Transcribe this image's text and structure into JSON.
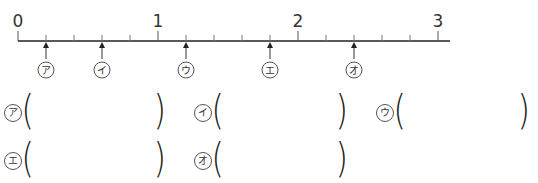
{
  "number_line": {
    "start": 0,
    "end": 3,
    "subdivisions_per_unit": 5,
    "major_labels": [
      "0",
      "1",
      "2",
      "3"
    ],
    "arrows": [
      {
        "label": "ア",
        "value": 0.2
      },
      {
        "label": "イ",
        "value": 0.6
      },
      {
        "label": "ウ",
        "value": 1.2
      },
      {
        "label": "エ",
        "value": 1.8
      },
      {
        "label": "オ",
        "value": 2.4
      }
    ],
    "line_color": "#222222"
  },
  "answers": [
    {
      "label": "ア",
      "value": ""
    },
    {
      "label": "イ",
      "value": ""
    },
    {
      "label": "ウ",
      "value": ""
    },
    {
      "label": "エ",
      "value": ""
    },
    {
      "label": "オ",
      "value": ""
    }
  ],
  "parens": {
    "open": "(",
    "close": ")"
  }
}
